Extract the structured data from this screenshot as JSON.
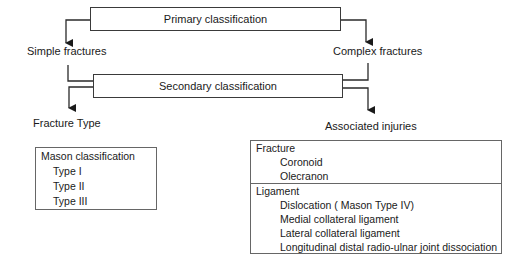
{
  "diagram": {
    "primary": {
      "label": "Primary classification"
    },
    "secondary": {
      "label": "Secondary classification"
    },
    "branches": {
      "left_primary": "Simple fractures",
      "right_primary": "Complex fractures",
      "left_secondary": "Fracture Type",
      "right_secondary": "Associated injuries"
    },
    "mason_box": {
      "title": "Mason classification",
      "items": [
        "Type I",
        "Type II",
        "Type III"
      ]
    },
    "injuries_box": {
      "sections": [
        {
          "title": "Fracture",
          "items": [
            "Coronoid",
            "Olecranon"
          ]
        },
        {
          "title": "Ligament",
          "items": [
            "Dislocation ( Mason Type IV)",
            "Medial collateral ligament",
            "Lateral collateral ligament",
            "Longitudinal distal radio-ulnar joint dissociation"
          ]
        }
      ]
    },
    "colors": {
      "line": "#2a2a2a",
      "text": "#1a1a1a",
      "border": "#3a3a3a"
    }
  }
}
